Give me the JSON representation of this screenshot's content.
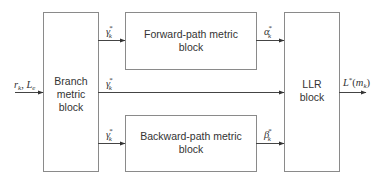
{
  "diagram": {
    "blocks": {
      "branch": {
        "lines": [
          "Branch",
          "metric",
          "block"
        ]
      },
      "forward": {
        "lines": [
          "Forward-path metric",
          "block"
        ]
      },
      "backward": {
        "lines": [
          "Backward-path metric",
          "block"
        ]
      },
      "llr": {
        "lines": [
          "LLR",
          "block"
        ]
      }
    },
    "signals": {
      "input": {
        "base": "r",
        "sub": "k",
        "sep": ", ",
        "base2": "L",
        "sub2": "e"
      },
      "gamma_top": {
        "base": "γ",
        "sub": "k",
        "sup": "*"
      },
      "gamma_mid": {
        "base": "γ",
        "sub": "k",
        "sup": "*"
      },
      "gamma_bot": {
        "base": "γ",
        "sub": "k",
        "sup": "*"
      },
      "alpha": {
        "base": "α",
        "sub": "k",
        "sup": "*"
      },
      "beta": {
        "base": "β",
        "sub": "k",
        "sup": "*"
      },
      "output": {
        "base": "L",
        "sup": "*",
        "open": "(",
        "arg": "m",
        "sub": "k",
        "close": ")"
      }
    },
    "colors": {
      "box_stroke": "#8a8a8a",
      "line": "#444444",
      "text": "#333333"
    }
  }
}
